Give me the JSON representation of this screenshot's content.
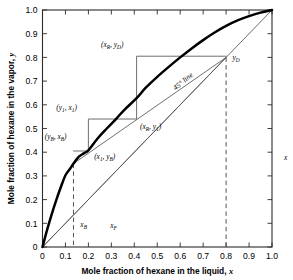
{
  "chart_data": {
    "type": "line",
    "title": "",
    "xlabel": "Mole fraction of hexane in the liquid, x",
    "ylabel": "Mole fraction of hexane in the vapor, y",
    "xlim": [
      0,
      1.0
    ],
    "ylim": [
      0,
      1.0
    ],
    "grid": false,
    "legend": "none",
    "xticks": [
      "0",
      "0.1",
      "0.2",
      "0.3",
      "0.4",
      "0.5",
      "0.6",
      "0.7",
      "0.8",
      "0.9",
      "1.0"
    ],
    "yticks": [
      "0",
      "0.1",
      "0.2",
      "0.3",
      "0.4",
      "0.5",
      "0.6",
      "0.7",
      "0.8",
      "0.9",
      "1.0"
    ],
    "xtick_values": [
      0,
      0.1,
      0.2,
      0.3,
      0.4,
      0.5,
      0.6,
      0.7,
      0.8,
      0.9,
      1.0
    ],
    "ytick_values": [
      0,
      0.1,
      0.2,
      0.3,
      0.4,
      0.5,
      0.6,
      0.7,
      0.8,
      0.9,
      1.0
    ],
    "series": [
      {
        "name": "equilibrium curve",
        "style": "thick-solid",
        "color": "#000000",
        "points": [
          [
            0.0,
            0.0
          ],
          [
            0.02,
            0.072
          ],
          [
            0.04,
            0.138
          ],
          [
            0.06,
            0.198
          ],
          [
            0.08,
            0.253
          ],
          [
            0.1,
            0.303
          ],
          [
            0.12,
            0.33
          ],
          [
            0.135,
            0.352
          ],
          [
            0.16,
            0.382
          ],
          [
            0.18,
            0.395
          ],
          [
            0.2,
            0.408
          ],
          [
            0.24,
            0.458
          ],
          [
            0.28,
            0.5
          ],
          [
            0.32,
            0.54
          ],
          [
            0.36,
            0.582
          ],
          [
            0.41,
            0.628
          ],
          [
            0.45,
            0.672
          ],
          [
            0.5,
            0.718
          ],
          [
            0.55,
            0.76
          ],
          [
            0.6,
            0.8
          ],
          [
            0.65,
            0.838
          ],
          [
            0.7,
            0.873
          ],
          [
            0.75,
            0.905
          ],
          [
            0.8,
            0.933
          ],
          [
            0.85,
            0.956
          ],
          [
            0.9,
            0.974
          ],
          [
            0.95,
            0.989
          ],
          [
            1.0,
            1.0
          ]
        ]
      },
      {
        "name": "45 degree line",
        "style": "thin-solid",
        "color": "#555555",
        "points": [
          [
            0.0,
            0.0
          ],
          [
            1.0,
            1.0
          ]
        ]
      },
      {
        "name": "rectifying operating line",
        "style": "thin-solid",
        "color": "#555555",
        "points": [
          [
            0.135,
            0.352
          ],
          [
            0.8,
            0.8
          ]
        ]
      },
      {
        "name": "stripping operating line",
        "style": "thin-solid",
        "color": "#555555",
        "points": [
          [
            0.0,
            0.0
          ],
          [
            0.8,
            0.8
          ]
        ]
      },
      {
        "name": "staircase construction",
        "style": "thin-solid",
        "color": "#555555",
        "points": [
          [
            0.8,
            0.805
          ],
          [
            0.41,
            0.805
          ],
          [
            0.41,
            0.54
          ],
          [
            0.2,
            0.54
          ],
          [
            0.2,
            0.405
          ],
          [
            0.135,
            0.405
          ]
        ]
      }
    ],
    "dashed_verticals": [
      {
        "name": "x_B dashed line",
        "x": 0.135,
        "y_top": 0.352,
        "y_bottom": 0.0
      },
      {
        "name": "x_D dashed line",
        "x": 0.8,
        "y_top": 0.8,
        "y_bottom": 0.0
      }
    ],
    "annotations": [
      {
        "id": "xR_yD",
        "text": "(x_R, y_D)",
        "at": [
          0.41,
          0.805
        ],
        "label_at": [
          0.255,
          0.845
        ]
      },
      {
        "id": "y1_x1",
        "text": "(y_1, x_1)",
        "at": [
          0.2,
          0.54
        ],
        "label_at": [
          0.06,
          0.58
        ]
      },
      {
        "id": "yB_xB",
        "text": "(y_B, x_B)",
        "at": [
          0.135,
          0.405
        ],
        "label_at": [
          0.01,
          0.455
        ]
      },
      {
        "id": "x1_yB",
        "text": "(x_1, y_B)",
        "at": [
          0.2,
          0.405
        ],
        "label_at": [
          0.225,
          0.37
        ]
      },
      {
        "id": "xR_y1",
        "text": "(x_R, y_1)",
        "at": [
          0.41,
          0.54
        ],
        "label_at": [
          0.425,
          0.497
        ]
      },
      {
        "id": "yD",
        "text": "y_D",
        "at": [
          0.8,
          0.8
        ],
        "label_at": [
          0.828,
          0.79
        ]
      },
      {
        "id": "line45",
        "text": "45° line",
        "at": [
          0.6,
          0.6
        ],
        "label_at": [
          0.58,
          0.66
        ],
        "rotation": -40
      },
      {
        "id": "xB",
        "text": "x_B",
        "at": [
          0.135,
          0.0
        ],
        "label_at": [
          0.165,
          0.085
        ]
      },
      {
        "id": "xF",
        "text": "x_F",
        "at": [
          0.3,
          0.0
        ],
        "label_at": [
          0.295,
          0.08
        ]
      }
    ]
  },
  "annotation_text": {
    "xR_yD": {
      "pre": "(",
      "v1": "x",
      "s1": "R",
      "mid": ", ",
      "v2": "y",
      "s2": "D",
      "post": ")"
    },
    "y1_x1": {
      "pre": "(",
      "v1": "y",
      "s1": "1",
      "mid": ", ",
      "v2": "x",
      "s2": "1",
      "post": ")"
    },
    "yB_xB": {
      "pre": "(",
      "v1": "y",
      "s1": "B",
      "mid": ", ",
      "v2": "x",
      "s2": "B",
      "post": ")"
    },
    "x1_yB": {
      "pre": "(",
      "v1": "x",
      "s1": "1",
      "mid": ", ",
      "v2": "y",
      "s2": "B",
      "post": ")"
    },
    "xR_y1": {
      "pre": "(",
      "v1": "x",
      "s1": "R",
      "mid": ", ",
      "v2": "y",
      "s2": "1",
      "post": ")"
    },
    "yD": {
      "v1": "y",
      "s1": "D"
    },
    "xB": {
      "v1": "x",
      "s1": "B"
    },
    "xF": {
      "v1": "x",
      "s1": "F"
    },
    "line45": {
      "v1": "45° line"
    }
  },
  "axis_titles": {
    "x": {
      "text": "Mole fraction of hexane in the liquid,",
      "var": "x"
    },
    "y": {
      "text": "Mole fraction of hexane in the vapor,",
      "var": "y"
    }
  },
  "colors": {
    "curve": "#000000",
    "thin_line": "#555555",
    "frame": "#2b2b2b",
    "dash": "#555555",
    "background": "#ffffff"
  }
}
